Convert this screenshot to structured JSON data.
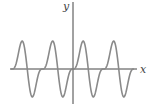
{
  "chart_data": {
    "type": "line",
    "title": "",
    "xlabel": "x",
    "ylabel": "y",
    "grid": false,
    "legend": null,
    "axes_style": "centered-cartesian",
    "series": [
      {
        "name": "periodic function",
        "description": "Periodic wave passing through the origin with a flat inflection at each zero-level start of period, sharp peak then deep trough; about 4 periods visible, 1.3 periods left of the y-axis (starting at origin) and ~2 to the right",
        "color": "#8a8a8a",
        "approx_formula": "y = sin(t) - 0.5*sin(2t)",
        "peaks_x_px": [
          22,
          52,
          83,
          113
        ],
        "troughs_x_px": [
          32,
          63,
          94,
          124
        ],
        "relative_amplitude": 1.3
      }
    ],
    "axes": {
      "origin_px": [
        73,
        69
      ],
      "x_axis_px_range": [
        10,
        136
      ],
      "y_axis_px_range": [
        2,
        103
      ],
      "period_px": 30.5,
      "amplitude_px": 28
    }
  },
  "labels": {
    "x_axis": "x",
    "y_axis": "y"
  }
}
